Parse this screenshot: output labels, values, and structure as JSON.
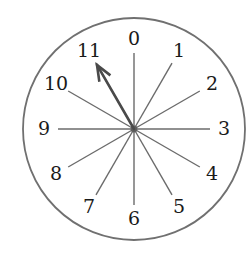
{
  "figure": {
    "background_color": "#ffffff",
    "width": 252,
    "height": 255
  },
  "dial": {
    "center_x": 134,
    "center_y": 129,
    "rim_radius": 111,
    "rim_color": "#707070",
    "rim_width": 1.8,
    "face_color": "#ffffff",
    "label_radius": 90,
    "spoke_inner_radius": 0,
    "spoke_outer_radius": 76,
    "spoke_color": "#6b6b6b",
    "spoke_width": 1.4,
    "hub_color": "#5e5e5e",
    "hub_radius": 3.4
  },
  "labels": {
    "color": "#1a1a1a",
    "font_size": 19,
    "ticks": [
      {
        "text": "0",
        "angle_deg": 0,
        "index": 0
      },
      {
        "text": "1",
        "angle_deg": 30,
        "index": 1
      },
      {
        "text": "2",
        "angle_deg": 60,
        "index": 2
      },
      {
        "text": "3",
        "angle_deg": 90,
        "index": 3
      },
      {
        "text": "4",
        "angle_deg": 120,
        "index": 4
      },
      {
        "text": "5",
        "angle_deg": 150,
        "index": 5
      },
      {
        "text": "6",
        "angle_deg": 180,
        "index": 6
      },
      {
        "text": "7",
        "angle_deg": 210,
        "index": 7
      },
      {
        "text": "8",
        "angle_deg": 240,
        "index": 8
      },
      {
        "text": "9",
        "angle_deg": 270,
        "index": 9
      },
      {
        "text": "10",
        "angle_deg": 300,
        "index": 10
      },
      {
        "text": "11",
        "angle_deg": 330,
        "index": 11
      }
    ]
  },
  "pointer": {
    "name": "clock-hand",
    "points_to_label": "11",
    "angle_deg": 330,
    "length": 74,
    "color": "#4a4a4a",
    "shaft_width": 2.6,
    "barb_width": 2.6,
    "barb_length": 17,
    "barb_spread_deg": 22
  },
  "chart_data": {
    "type": "scatter",
    "xlabel": "",
    "ylabel": "",
    "categories": [
      "0",
      "1",
      "2",
      "3",
      "4",
      "5",
      "6",
      "7",
      "8",
      "9",
      "10",
      "11"
    ],
    "values": [
      0,
      30,
      60,
      90,
      120,
      150,
      180,
      210,
      240,
      270,
      300,
      330
    ],
    "annotations": [
      "pointer indicates 11"
    ],
    "legend": "none",
    "grid": false
  }
}
